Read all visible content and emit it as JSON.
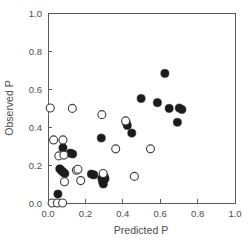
{
  "chart_data": {
    "type": "scatter",
    "title": "",
    "xlabel": "Predicted P",
    "ylabel": "Observed P",
    "xlim": [
      0.0,
      1.0
    ],
    "ylim": [
      0.0,
      1.0
    ],
    "xticks": [
      "0.0",
      "0.2",
      "0.4",
      "0.6",
      "0.8",
      "1.0"
    ],
    "xtick_values": [
      0.0,
      0.2,
      0.4,
      0.6,
      0.8,
      1.0
    ],
    "yticks": [
      "0.0",
      "0.2",
      "0.4",
      "0.6",
      "0.8",
      "1.0"
    ],
    "ytick_values": [
      0.0,
      0.2,
      0.4,
      0.6,
      0.8,
      1.0
    ],
    "grid": false,
    "legend": "none",
    "frame": "box",
    "series": [
      {
        "name": "filled",
        "marker": "filled-circle",
        "color": "#1c1c1c",
        "points": [
          [
            0.053,
            0.047
          ],
          [
            0.063,
            0.18
          ],
          [
            0.072,
            0.17
          ],
          [
            0.08,
            0.29
          ],
          [
            0.082,
            0.162
          ],
          [
            0.09,
            0.155
          ],
          [
            0.12,
            0.262
          ],
          [
            0.132,
            0.258
          ],
          [
            0.232,
            0.152
          ],
          [
            0.245,
            0.148
          ],
          [
            0.285,
            0.342
          ],
          [
            0.288,
            0.13
          ],
          [
            0.292,
            0.112
          ],
          [
            0.296,
            0.1
          ],
          [
            0.3,
            0.142
          ],
          [
            0.305,
            0.128
          ],
          [
            0.418,
            0.425
          ],
          [
            0.424,
            0.408
          ],
          [
            0.448,
            0.368
          ],
          [
            0.498,
            0.55
          ],
          [
            0.585,
            0.528
          ],
          [
            0.625,
            0.682
          ],
          [
            0.648,
            0.498
          ],
          [
            0.692,
            0.425
          ],
          [
            0.702,
            0.5
          ],
          [
            0.716,
            0.492
          ]
        ]
      },
      {
        "name": "open",
        "marker": "open-circle",
        "color": "#3d3d3d",
        "points": [
          [
            0.012,
            0.5
          ],
          [
            0.022,
            0.0
          ],
          [
            0.03,
            0.332
          ],
          [
            0.05,
            0.0
          ],
          [
            0.058,
            0.248
          ],
          [
            0.078,
            0.0
          ],
          [
            0.08,
            0.332
          ],
          [
            0.085,
            0.252
          ],
          [
            0.088,
            0.112
          ],
          [
            0.13,
            0.498
          ],
          [
            0.152,
            0.172
          ],
          [
            0.16,
            0.178
          ],
          [
            0.175,
            0.118
          ],
          [
            0.288,
            0.465
          ],
          [
            0.295,
            0.155
          ],
          [
            0.362,
            0.285
          ],
          [
            0.415,
            0.432
          ],
          [
            0.462,
            0.14
          ],
          [
            0.548,
            0.285
          ]
        ]
      }
    ]
  },
  "axes": {
    "x_title": "Predicted P",
    "y_title": "Observed P"
  }
}
